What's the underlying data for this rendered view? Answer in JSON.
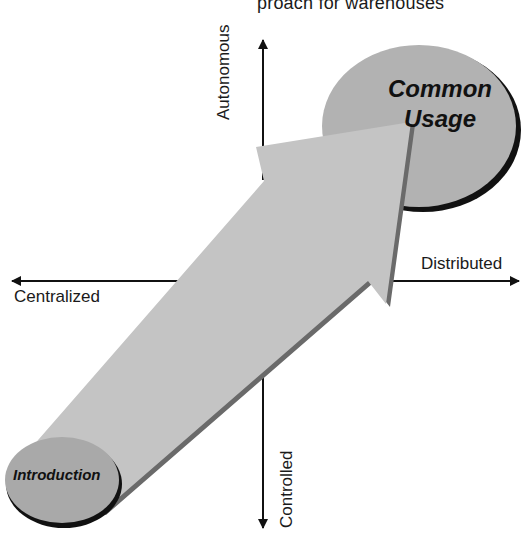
{
  "caption_fragment": "proach for warehouses",
  "axes": {
    "horizontal": {
      "left_label": "Centralized",
      "right_label": "Distributed"
    },
    "vertical": {
      "top_label": "Autonomous",
      "bottom_label": "Controlled"
    }
  },
  "stages": {
    "start": {
      "label": "Introduction"
    },
    "end": {
      "label_line1": "Common",
      "label_line2": "Usage"
    }
  },
  "colors": {
    "arrow_fill": "#c4c4c4",
    "arrow_shadow": "#6a6a6a",
    "ellipse_fill": "#b2b2b2",
    "outline": "#111111",
    "axis": "#111111"
  }
}
